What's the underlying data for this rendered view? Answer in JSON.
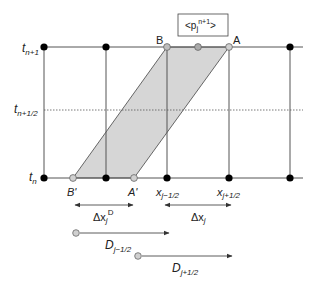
{
  "diagram": {
    "type": "finite-volume space-time cell",
    "colors": {
      "line": "#333333",
      "node_fill": "#000000",
      "hollow_fill": "#bdbdbd",
      "hollow_stroke": "#666666",
      "shade": "#d6d6d6"
    },
    "time_labels": {
      "t_top": {
        "base": "t",
        "sub": "n+1"
      },
      "t_mid": {
        "base": "t",
        "sub": "n+1/2"
      },
      "t_bot": {
        "base": "t",
        "sub": "n"
      }
    },
    "point_labels": {
      "B": "B",
      "A": "A",
      "B_prime": "B'",
      "A_prime": "A'"
    },
    "x_labels": {
      "left": {
        "base": "x",
        "sub": "j−1/2"
      },
      "right": {
        "base": "x",
        "sub": "j+1/2"
      }
    },
    "box_label": {
      "open": "<p",
      "sub": "j",
      "sup": "n+1",
      "close": ">"
    },
    "dim_labels": {
      "dxD": {
        "base": "Δx",
        "sub": "j",
        "sup": "D"
      },
      "dx": {
        "base": "Δx",
        "sub": "j"
      }
    },
    "flux_labels": {
      "D_left": {
        "base": "D",
        "sub": "j−1/2"
      },
      "D_right": {
        "base": "D",
        "sub": "j+1/2"
      }
    }
  }
}
